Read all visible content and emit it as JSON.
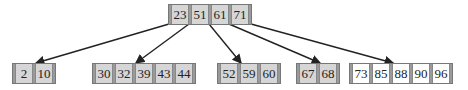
{
  "diagram": {
    "type": "b-tree",
    "root": {
      "keys": [
        "23",
        "51",
        "61",
        "71"
      ]
    },
    "leaves": [
      {
        "keys": [
          "2",
          "10"
        ],
        "highlight": false
      },
      {
        "keys": [
          "30",
          "32",
          "39",
          "43",
          "44"
        ],
        "highlight": false
      },
      {
        "keys": [
          "52",
          "59",
          "60"
        ],
        "highlight": false
      },
      {
        "keys": [
          "67",
          "68"
        ],
        "highlight": false
      },
      {
        "keys": [
          "73",
          "85",
          "88",
          "90",
          "96"
        ],
        "highlight": true
      }
    ],
    "edges": [
      {
        "from": "root",
        "to_leaf": 0
      },
      {
        "from": "root",
        "to_leaf": 1
      },
      {
        "from": "root",
        "to_leaf": 2
      },
      {
        "from": "root",
        "to_leaf": 3
      },
      {
        "from": "root",
        "to_leaf": 4
      }
    ],
    "colors": {
      "cell_fill": "#d6d6d6",
      "highlight_cell_fill": "#ffffff",
      "border": "#777777",
      "edge": "#222222"
    }
  }
}
